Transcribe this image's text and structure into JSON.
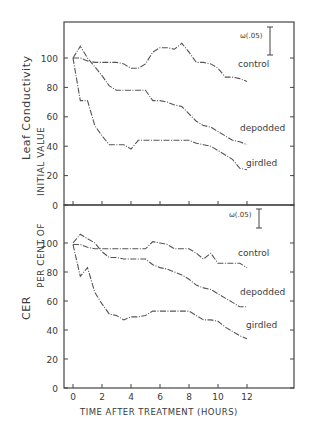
{
  "chart_data": [
    {
      "type": "line",
      "panel": "top",
      "title": "",
      "ylabel": "Leaf Conductivity",
      "ylabel_secondary": "INITIAL VALUE",
      "xlabel": "",
      "ylim": [
        0,
        120
      ],
      "xlim": [
        -1,
        15.5
      ],
      "yticks": [
        0,
        20,
        40,
        60,
        80,
        100
      ],
      "xticks": [
        0,
        2,
        4,
        6,
        8,
        10,
        12
      ],
      "grid": false,
      "error_bar_label": "ω(.05)",
      "error_bar_size": 19,
      "series": [
        {
          "name": "control",
          "x": [
            0,
            0.5,
            1,
            1.5,
            2,
            2.5,
            3,
            3.5,
            4,
            4.5,
            5,
            5.5,
            6,
            6.5,
            7,
            7.5,
            8,
            8.5,
            9,
            9.5,
            10,
            10.5,
            11,
            11.5,
            12
          ],
          "values": [
            100,
            100,
            98,
            97,
            97,
            97,
            97,
            96,
            93,
            93,
            96,
            104,
            107,
            107,
            106,
            110,
            104,
            97,
            97,
            96,
            93,
            87,
            87,
            86,
            84
          ]
        },
        {
          "name": "depodded",
          "x": [
            0,
            0.5,
            1,
            1.5,
            2,
            2.5,
            3,
            3.5,
            4,
            4.5,
            5,
            5.5,
            6,
            6.5,
            7,
            7.5,
            8,
            8.5,
            9,
            9.5,
            10,
            10.5,
            11,
            11.5,
            12
          ],
          "values": [
            100,
            108,
            100,
            94,
            88,
            81,
            78,
            78,
            78,
            78,
            78,
            71,
            71,
            70,
            68,
            67,
            62,
            57,
            54,
            53,
            50,
            47,
            44,
            43,
            41
          ]
        },
        {
          "name": "girdled",
          "x": [
            0,
            0.5,
            1,
            1.5,
            2,
            2.5,
            3,
            3.5,
            4,
            4.5,
            5,
            5.5,
            6,
            6.5,
            7,
            7.5,
            8,
            8.5,
            9,
            9.5,
            10,
            10.5,
            11,
            11.5,
            12
          ],
          "values": [
            100,
            71,
            71,
            54,
            47,
            41,
            41,
            41,
            38,
            44,
            44,
            44,
            44,
            44,
            44,
            44,
            44,
            42,
            41,
            40,
            37,
            34,
            31,
            25,
            24
          ]
        }
      ],
      "series_labels": [
        "control",
        "depodded",
        "girdled"
      ]
    },
    {
      "type": "line",
      "panel": "bottom",
      "title": "",
      "ylabel": "CER",
      "ylabel_secondary": "PER CENT OF INITIAL VALUE",
      "xlabel": "TIME AFTER TREATMENT (HOURS)",
      "ylim": [
        0,
        120
      ],
      "xlim": [
        -1,
        15.5
      ],
      "yticks": [
        0,
        20,
        40,
        60,
        80,
        100
      ],
      "xticks": [
        0,
        2,
        4,
        6,
        8,
        10,
        12
      ],
      "grid": false,
      "error_bar_label": "ω(.05)",
      "error_bar_size": 9,
      "series": [
        {
          "name": "control",
          "x": [
            0,
            0.5,
            1,
            1.5,
            2,
            2.5,
            3,
            3.5,
            4,
            4.5,
            5,
            5.5,
            6,
            6.5,
            7,
            7.5,
            8,
            8.5,
            9,
            9.5,
            10,
            10.5,
            11,
            11.5,
            12
          ],
          "values": [
            99,
            99,
            97,
            96,
            96,
            96,
            96,
            96,
            96,
            96,
            96,
            101,
            100,
            99,
            96,
            96,
            96,
            93,
            89,
            93,
            86,
            86,
            86,
            86,
            83
          ]
        },
        {
          "name": "depodded",
          "x": [
            0,
            0.5,
            1,
            1.5,
            2,
            2.5,
            3,
            3.5,
            4,
            4.5,
            5,
            5.5,
            6,
            6.5,
            7,
            7.5,
            8,
            8.5,
            9,
            9.5,
            10,
            10.5,
            11,
            11.5,
            12
          ],
          "values": [
            100,
            106,
            103,
            100,
            94,
            90,
            90,
            89,
            89,
            89,
            89,
            85,
            83,
            82,
            80,
            78,
            75,
            71,
            69,
            68,
            65,
            62,
            59,
            56,
            56
          ]
        },
        {
          "name": "girdled",
          "x": [
            0,
            0.5,
            1,
            1.5,
            2,
            2.5,
            3,
            3.5,
            4,
            4.5,
            5,
            5.5,
            6,
            6.5,
            7,
            7.5,
            8,
            8.5,
            9,
            9.5,
            10,
            10.5,
            11,
            11.5,
            12
          ],
          "values": [
            99,
            77,
            83,
            66,
            58,
            51,
            50,
            47,
            49,
            49,
            50,
            53,
            53,
            53,
            53,
            53,
            53,
            50,
            47,
            47,
            46,
            42,
            39,
            36,
            34
          ]
        }
      ],
      "series_labels": [
        "control",
        "depodded",
        "girdled"
      ]
    }
  ],
  "labels": {
    "top_ylabel": "Leaf Conductivity",
    "shared_ylabel": "PER CENT OF INITIAL VALUE",
    "shared_ylabel_top_part": "INITIAL VALUE",
    "shared_ylabel_bottom_part": "PER CENT OF",
    "bottom_ylabel": "CER",
    "xlabel": "TIME AFTER TREATMENT (HOURS)",
    "error_bar": "ω(.05)",
    "series_labels": [
      "control",
      "depodded",
      "girdled"
    ],
    "yticks": [
      "0",
      "20",
      "40",
      "60",
      "80",
      "100"
    ],
    "xticks": [
      "0",
      "2",
      "4",
      "6",
      "8",
      "10",
      "12"
    ]
  },
  "colors": {
    "ink": "#444444",
    "background": "#ffffff"
  }
}
